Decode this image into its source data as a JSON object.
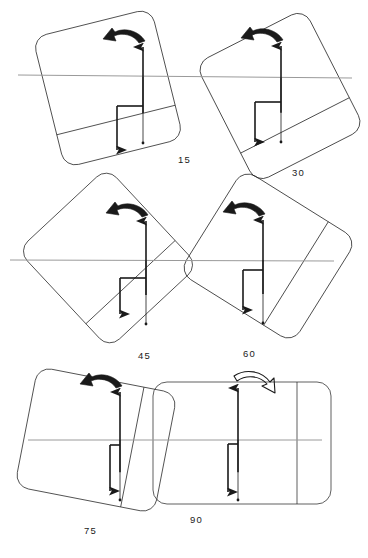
{
  "figure": {
    "type": "technical-line-diagram",
    "width": 368,
    "height": 558,
    "background_color": "#ffffff",
    "stroke_color": "#1a1a1a",
    "reference_line_color": "#9a9a9a",
    "panel_stroke_width": 0.7,
    "vector_stroke_width": 1.6
  },
  "reference_lines": [
    {
      "name": "row-1-horizon",
      "x1": 18,
      "y1": 75,
      "x2": 352,
      "y2": 78
    },
    {
      "name": "row-2-horizon",
      "x1": 10,
      "y1": 260,
      "x2": 334,
      "y2": 261
    },
    {
      "name": "row-3-horizon",
      "x1": 28,
      "y1": 440,
      "x2": 322,
      "y2": 440
    }
  ],
  "panels": [
    {
      "label": "15",
      "angle_deg": 15,
      "label_x": 178,
      "label_y": 163,
      "center_x": 108,
      "center_y": 88,
      "panel_w": 122,
      "panel_h": 134,
      "rotation": -14,
      "corner_radius": 14,
      "divider_offset": 34,
      "arrow_style": "filled",
      "arrow_direction": "left",
      "vector_origin_x": 143,
      "vector_origin_y": 77,
      "up_len": 30,
      "down_len": 58,
      "tick_w": 26,
      "tick_drop": 29,
      "stem_len": 44
    },
    {
      "label": "30",
      "angle_deg": 30,
      "label_x": 292,
      "label_y": 176,
      "center_x": 280,
      "center_y": 96,
      "panel_w": 122,
      "panel_h": 134,
      "rotation": -27,
      "corner_radius": 14,
      "divider_offset": 34,
      "arrow_style": "filled",
      "arrow_direction": "left",
      "vector_origin_x": 281,
      "vector_origin_y": 78,
      "up_len": 32,
      "down_len": 56,
      "tick_w": 26,
      "tick_drop": 24,
      "stem_len": 40
    },
    {
      "label": "45",
      "angle_deg": 45,
      "label_x": 138,
      "label_y": 359,
      "center_x": 108,
      "center_y": 258,
      "panel_w": 122,
      "panel_h": 134,
      "rotation": -43,
      "corner_radius": 14,
      "divider_offset": 34,
      "arrow_style": "filled",
      "arrow_direction": "left",
      "vector_origin_x": 146,
      "vector_origin_y": 261,
      "up_len": 40,
      "down_len": 55,
      "tick_w": 26,
      "tick_drop": 17,
      "stem_len": 36
    },
    {
      "label": "60",
      "angle_deg": 60,
      "label_x": 243,
      "label_y": 357,
      "center_x": 268,
      "center_y": 256,
      "panel_w": 122,
      "panel_h": 134,
      "rotation": -58,
      "corner_radius": 14,
      "divider_offset": 34,
      "arrow_style": "filled",
      "arrow_direction": "left",
      "vector_origin_x": 263,
      "vector_origin_y": 260,
      "up_len": 40,
      "down_len": 55,
      "tick_w": 20,
      "tick_drop": 10,
      "stem_len": 40
    },
    {
      "label": "75",
      "angle_deg": 75,
      "label_x": 84,
      "label_y": 534,
      "center_x": 96,
      "center_y": 440,
      "panel_w": 122,
      "panel_h": 142,
      "rotation": -79,
      "corner_radius": 14,
      "divider_offset": 34,
      "arrow_style": "filled",
      "arrow_direction": "left",
      "vector_origin_x": 120,
      "vector_origin_y": 440,
      "up_len": 48,
      "down_len": 52,
      "tick_w": 10,
      "tick_drop": 5,
      "stem_len": 46
    },
    {
      "label": "90",
      "angle_deg": 90,
      "label_x": 190,
      "label_y": 523,
      "center_x": 242,
      "center_y": 443,
      "panel_w": 122,
      "panel_h": 178,
      "rotation": -90,
      "corner_radius": 14,
      "divider_offset": 34,
      "arrow_style": "outlined",
      "arrow_direction": "right",
      "vector_origin_x": 238,
      "vector_origin_y": 440,
      "up_len": 52,
      "down_len": 52,
      "tick_w": 10,
      "tick_drop": 4,
      "stem_len": 48
    }
  ]
}
